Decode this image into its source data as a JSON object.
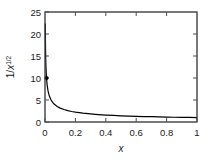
{
  "chart_data": {
    "type": "line",
    "title": "",
    "subtitle": "",
    "xlabel": "x",
    "ylabel": "1/x^1/2",
    "ylabel_parts": {
      "prefix": "1/",
      "variable": "x",
      "exponent": "1/2"
    },
    "xlim": [
      0,
      1
    ],
    "ylim": [
      0,
      25
    ],
    "xticks": [
      0,
      0.2,
      0.4,
      0.6,
      0.8,
      1
    ],
    "xticklabels": [
      "0",
      "0.2",
      "0.4",
      "0.6",
      "0.8",
      "1"
    ],
    "yticks": [
      0,
      5,
      10,
      15,
      20,
      25
    ],
    "yticklabels": [
      "0",
      "5",
      "10",
      "15",
      "20",
      "25"
    ],
    "grid": false,
    "legend": null,
    "tick_direction": "in",
    "frame": "full-box",
    "series": [
      {
        "name": "1/x^1/2",
        "color": "#000000",
        "x": [
          0.002,
          0.0025,
          0.003,
          0.004,
          0.005,
          0.006,
          0.008,
          0.01,
          0.0125,
          0.015,
          0.02,
          0.025,
          0.03,
          0.04,
          0.05,
          0.06,
          0.08,
          0.1,
          0.125,
          0.15,
          0.175,
          0.2,
          0.25,
          0.3,
          0.35,
          0.4,
          0.45,
          0.5,
          0.55,
          0.6,
          0.65,
          0.7,
          0.75,
          0.8,
          0.85,
          0.9,
          0.95,
          1.0
        ],
        "y": [
          22.36,
          20.0,
          18.26,
          15.81,
          14.14,
          12.91,
          11.18,
          10.0,
          8.94,
          8.16,
          7.07,
          6.32,
          5.77,
          5.0,
          4.47,
          4.08,
          3.54,
          3.16,
          2.83,
          2.58,
          2.39,
          2.24,
          2.0,
          1.83,
          1.69,
          1.58,
          1.49,
          1.41,
          1.35,
          1.29,
          1.24,
          1.2,
          1.15,
          1.12,
          1.08,
          1.05,
          1.03,
          1.0
        ]
      }
    ],
    "markers": [
      {
        "x": 0.01,
        "y": 10.0,
        "shape": "circle",
        "color": "#000000"
      }
    ]
  },
  "figure": {
    "background_color": "#ffffff",
    "axis_color": "#4d4d4d",
    "curve_color": "#000000",
    "text_color": "#1a1a1a"
  }
}
